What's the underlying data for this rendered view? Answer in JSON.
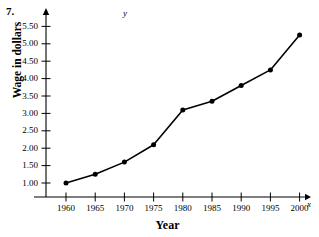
{
  "problem": {
    "number": "7."
  },
  "chart_data": {
    "type": "line",
    "title": "",
    "xlabel": "Year",
    "ylabel": "Wage in dollars",
    "x_axis_variable": "x",
    "y_axis_variable": "y",
    "categories": [
      1960,
      1965,
      1970,
      1975,
      1980,
      1985,
      1990,
      1995,
      2000
    ],
    "x": [
      1960,
      1965,
      1970,
      1975,
      1980,
      1985,
      1990,
      1995,
      2000
    ],
    "values": [
      1.0,
      1.25,
      1.6,
      2.1,
      3.1,
      3.35,
      3.8,
      4.25,
      5.25
    ],
    "series": [
      {
        "name": "Wage",
        "values": [
          1.0,
          1.25,
          1.6,
          2.1,
          3.1,
          3.35,
          3.8,
          4.25,
          5.25
        ]
      }
    ],
    "xlim": [
      1957,
      2004
    ],
    "ylim": [
      0.6,
      5.8
    ],
    "xticks": [
      1960,
      1965,
      1970,
      1975,
      1980,
      1985,
      1990,
      1995,
      2000
    ],
    "xtick_labels": [
      "1960",
      "1965",
      "1970",
      "1975",
      "1980",
      "1985",
      "1990",
      "1995",
      "2000"
    ],
    "yticks": [
      1.0,
      1.5,
      2.0,
      2.5,
      3.0,
      3.5,
      4.0,
      4.5,
      5.0,
      5.5
    ],
    "ytick_labels": [
      "1.00",
      "1.50",
      "2.00",
      "2.50",
      "3.00",
      "3.50",
      "4.00",
      "4.50",
      "5.00",
      "5.50"
    ],
    "grid": false,
    "legend": null,
    "marker": "filled-circle",
    "line_color": "#000000",
    "marker_color": "#000000",
    "axis_color": "#000000",
    "background": "#ffffff"
  }
}
